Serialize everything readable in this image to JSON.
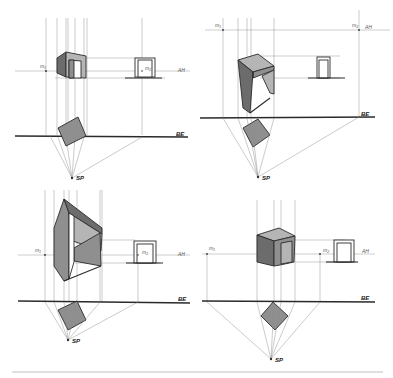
{
  "figure": {
    "type": "perspective-construction-sketches",
    "panels": [
      {
        "id": "top-left",
        "labels": {
          "measure_point_left": "m₁",
          "measure_point_right": "m₂",
          "horizon": "AH",
          "ground_line": "BE",
          "station_point": "SP"
        }
      },
      {
        "id": "top-right",
        "labels": {
          "measure_point_left": "m₁",
          "measure_point_right": "m₂",
          "horizon": "AH",
          "ground_line": "BE",
          "station_point": "SP"
        }
      },
      {
        "id": "bottom-left",
        "labels": {
          "measure_point_left": "m₁",
          "measure_point_right": "m₂",
          "horizon": "AH",
          "ground_line": "BE",
          "station_point": "SP"
        }
      },
      {
        "id": "bottom-right",
        "labels": {
          "measure_point_left": "m₁",
          "measure_point_right": "m₂",
          "horizon": "AH",
          "ground_line": "BE",
          "station_point": "SP"
        }
      }
    ]
  },
  "colors": {
    "ink": "#2b2b2b",
    "construction": "#9a9a9a",
    "shade_dark": "#6c6c6c",
    "shade_mid": "#8f8f8f",
    "shade_light": "#b5b5b5"
  }
}
